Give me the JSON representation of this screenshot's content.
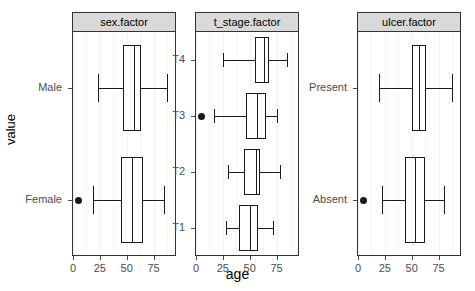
{
  "chart_data": {
    "type": "boxplot",
    "title": "",
    "xlabel": "age",
    "ylabel": "value",
    "xlim": [
      0,
      95
    ],
    "xticks": [
      0,
      25,
      50,
      75
    ],
    "xticklabels": [
      "0",
      "25",
      "50",
      "75"
    ],
    "grid": true,
    "legend": "none",
    "orientation": "horizontal",
    "facets": [
      {
        "strip": "sex.factor",
        "categories": [
          "Male",
          "Female"
        ],
        "boxes": [
          {
            "category": "Male",
            "whisker_low": 23,
            "q1": 47,
            "median": 57,
            "q3": 63,
            "whisker_high": 88,
            "outliers": []
          },
          {
            "category": "Female",
            "whisker_low": 19,
            "q1": 45,
            "median": 55,
            "q3": 65,
            "whisker_high": 85,
            "outliers": [
              5
            ]
          }
        ]
      },
      {
        "strip": "t_stage.factor",
        "categories": [
          "T4",
          "T3",
          "T2",
          "T1"
        ],
        "boxes": [
          {
            "category": "T4",
            "whisker_low": 25,
            "q1": 55,
            "median": 63,
            "q3": 68,
            "whisker_high": 85,
            "outliers": []
          },
          {
            "category": "T3",
            "whisker_low": 17,
            "q1": 47,
            "median": 57,
            "q3": 65,
            "whisker_high": 75,
            "outliers": [
              5
            ]
          },
          {
            "category": "T2",
            "whisker_low": 30,
            "q1": 45,
            "median": 56,
            "q3": 60,
            "whisker_high": 78,
            "outliers": []
          },
          {
            "category": "T1",
            "whisker_low": 28,
            "q1": 40,
            "median": 50,
            "q3": 58,
            "whisker_high": 72,
            "outliers": []
          }
        ]
      },
      {
        "strip": "ulcer.factor",
        "categories": [
          "Present",
          "Absent"
        ],
        "boxes": [
          {
            "category": "Present",
            "whisker_low": 20,
            "q1": 50,
            "median": 57,
            "q3": 63,
            "whisker_high": 88,
            "outliers": []
          },
          {
            "category": "Absent",
            "whisker_low": 22,
            "q1": 44,
            "median": 53,
            "q3": 62,
            "whisker_high": 80,
            "outliers": [
              5
            ]
          }
        ]
      }
    ]
  },
  "colors": {
    "strip_fill": "#d9d9d9",
    "panel_border": "#333333",
    "box_stroke": "#1a1a1a",
    "box_fill": "#ffffff",
    "text": "#4d4d4d",
    "gridline": "#f2f2f2"
  }
}
